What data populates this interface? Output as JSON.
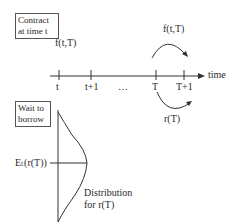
{
  "boxes": {
    "contract": [
      "Contract",
      "at time t"
    ],
    "wait": [
      "Wait to",
      "borrow"
    ]
  },
  "labels": {
    "forward_left": "f(t,T)",
    "forward_arc": "f(t,T)",
    "rate_arc": "r(T)",
    "axis_label": "time",
    "expectation": "Eₜ(r(T))",
    "dist_line1": "Distribution",
    "dist_line2": "for r(T)"
  },
  "ticks": [
    "t",
    "t+1",
    "…",
    "T",
    "T+1"
  ]
}
